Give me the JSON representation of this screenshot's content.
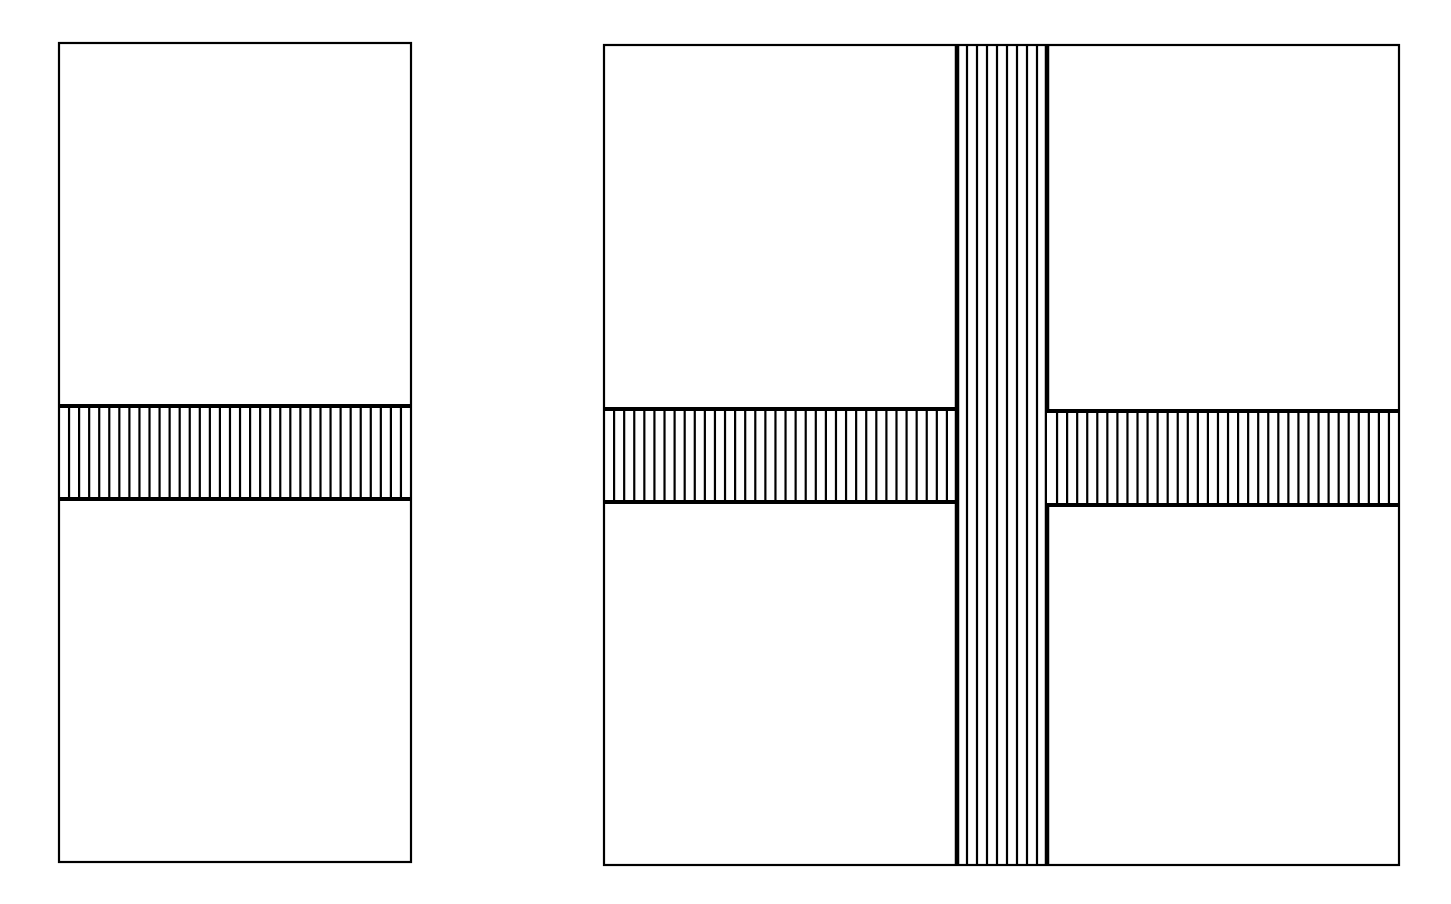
{
  "diagram": {
    "title": "",
    "background": "#ffffff",
    "stroke": "#000000",
    "hatch_pitch": 10,
    "figures": [
      {
        "id": "left-panel",
        "name": "single-band-panel",
        "outline": {
          "x": 59,
          "y": 43,
          "w": 352,
          "h": 819
        },
        "bands": [
          {
            "orientation": "horizontal",
            "hatch": "vertical-lines",
            "x": 59,
            "y": 406,
            "w": 352,
            "h": 93
          }
        ]
      },
      {
        "id": "right-panel",
        "name": "cross-band-panel",
        "outline": {
          "x": 604,
          "y": 45,
          "w": 795,
          "h": 820
        },
        "bands": [
          {
            "orientation": "horizontal",
            "hatch": "vertical-lines",
            "x": 604,
            "y": 409,
            "w": 353,
            "h": 93
          },
          {
            "orientation": "vertical",
            "hatch": "vertical-lines",
            "x": 957,
            "y": 45,
            "w": 90,
            "h": 820
          },
          {
            "orientation": "horizontal",
            "hatch": "vertical-lines",
            "x": 1047,
            "y": 411,
            "w": 352,
            "h": 94
          }
        ]
      }
    ]
  }
}
